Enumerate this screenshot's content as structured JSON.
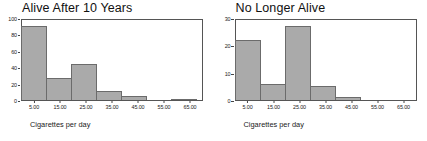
{
  "figure": {
    "background": "#ffffff",
    "bar_fill": "#aaaaaa",
    "bar_edge": "#6b6b6b",
    "axis_color": "#555555",
    "text_color": "#1a1a1a"
  },
  "panels": [
    {
      "id": "alive-after-10-years",
      "title": "Alive After 10 Years",
      "xlabel": "Cigarettes per day",
      "yticks": [
        "0",
        "20",
        "40",
        "60",
        "80",
        "100"
      ],
      "xticks": [
        "5.00",
        "15.00",
        "25.00",
        "35.00",
        "45.00",
        "55.00",
        "65.00"
      ]
    },
    {
      "id": "no-longer-alive",
      "title": "No Longer Alive",
      "xlabel": "Cigarettes per day",
      "yticks": [
        "0",
        "10",
        "20",
        "30"
      ],
      "xticks": [
        "5.00",
        "15.00",
        "25.00",
        "35.00",
        "45.00",
        "55.00",
        "65.00"
      ]
    }
  ],
  "chart_data": [
    {
      "type": "bar",
      "title": "Alive After 10 Years",
      "xlabel": "Cigarettes per day",
      "ylabel": "",
      "categories": [
        "5.00",
        "15.00",
        "25.00",
        "35.00",
        "45.00",
        "55.00",
        "65.00"
      ],
      "bin_edges": [
        0,
        10,
        20,
        30,
        40,
        50,
        60,
        70
      ],
      "values": [
        90,
        27,
        44,
        11,
        5,
        0,
        1
      ],
      "ylim": [
        0,
        100
      ],
      "yticks": [
        0,
        20,
        40,
        60,
        80,
        100
      ],
      "xlim": [
        0,
        70
      ],
      "grid": false,
      "legend": "none"
    },
    {
      "type": "bar",
      "title": "No Longer Alive",
      "xlabel": "Cigarettes per day",
      "ylabel": "",
      "categories": [
        "5.00",
        "15.00",
        "25.00",
        "35.00",
        "45.00",
        "55.00",
        "65.00"
      ],
      "bin_edges": [
        0,
        10,
        20,
        30,
        40,
        50,
        60,
        70
      ],
      "values": [
        22,
        6,
        27,
        5,
        1,
        0,
        0
      ],
      "ylim": [
        0,
        30
      ],
      "yticks": [
        0,
        10,
        20,
        30
      ],
      "xlim": [
        0,
        70
      ],
      "grid": false,
      "legend": "none"
    }
  ]
}
